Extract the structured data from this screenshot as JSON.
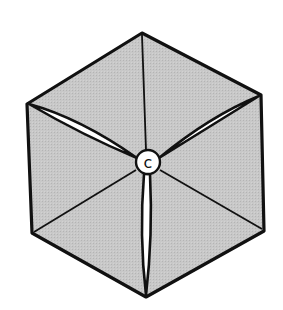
{
  "figure": {
    "type": "hexagonal-fold-diagram",
    "center_label": "c",
    "colors": {
      "fill": "#c4c4c4",
      "stroke": "#111111",
      "background": "#ffffff",
      "slit": "#ffffff"
    },
    "vertices": {
      "top": [
        142,
        33
      ],
      "upper_right": [
        261,
        95
      ],
      "lower_right": [
        264,
        231
      ],
      "bottom": [
        146,
        297
      ],
      "lower_left": [
        32,
        233
      ],
      "upper_left": [
        27,
        104
      ]
    },
    "center": [
      148,
      162
    ]
  },
  "top_fragments": [
    "~~ ~",
    "~~~~~",
    "~~~~",
    "~~~~~~~~"
  ]
}
